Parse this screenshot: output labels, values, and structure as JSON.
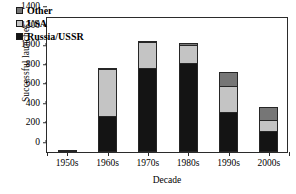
{
  "chart_data": {
    "type": "bar",
    "stacked": true,
    "title": "",
    "xlabel": "Decade",
    "ylabel": "Successful launches",
    "categories": [
      "1950s",
      "1960s",
      "1970s",
      "1980s",
      "1990s",
      "2000s"
    ],
    "ylim": [
      0,
      1400
    ],
    "yticks": [
      0,
      200,
      400,
      600,
      800,
      1000,
      1200,
      1400
    ],
    "ytick_labels": [
      "0",
      "200",
      "400",
      "600",
      "800",
      "1000",
      "1200",
      "1400"
    ],
    "minor_tick_step": 100,
    "grid": false,
    "legend_position": "top-left",
    "series": [
      {
        "name": "Russia/USSR",
        "color": "#141414",
        "values": [
          25,
          370,
          860,
          920,
          415,
          220
        ]
      },
      {
        "name": "USA",
        "color": "#c4c4c4",
        "values": [
          0,
          500,
          280,
          195,
          275,
          125
        ]
      },
      {
        "name": "Other",
        "color": "#767676",
        "values": [
          0,
          5,
          25,
          30,
          155,
          135
        ]
      }
    ],
    "totals": [
      25,
      875,
      1165,
      1145,
      845,
      480
    ],
    "legend_order": [
      "Other",
      "USA",
      "Russia/USSR"
    ]
  }
}
